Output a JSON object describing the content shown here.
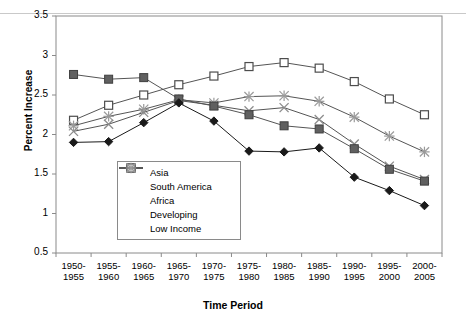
{
  "chart_data": {
    "type": "line",
    "title": "",
    "xlabel": "Time Period",
    "ylabel": "Percent Increase",
    "ylim": [
      0.5,
      3.5
    ],
    "ytick_labels": [
      "3.5",
      "3",
      "2.5",
      "2",
      "1.5",
      "1",
      "0.5"
    ],
    "ytick_values": [
      3.5,
      3,
      2.5,
      2,
      1.5,
      1,
      0.5
    ],
    "grid": false,
    "legend_position": "inside-bottom-left",
    "categories": [
      "1950-1955",
      "1955-1960",
      "1960-1965",
      "1965-1970",
      "1970-1975",
      "1975-1980",
      "1980-1985",
      "1985-1990",
      "1990-1995",
      "1995-2000",
      "2000-2005"
    ],
    "category_lines": [
      [
        "1950-",
        "1955"
      ],
      [
        "1955-",
        "1960"
      ],
      [
        "1960-",
        "1965"
      ],
      [
        "1965-",
        "1970"
      ],
      [
        "1970-",
        "1975"
      ],
      [
        "1975-",
        "1980"
      ],
      [
        "1980-",
        "1985"
      ],
      [
        "1985-",
        "1990"
      ],
      [
        "1990-",
        "1995"
      ],
      [
        "1995-",
        "2000"
      ],
      [
        "2000-",
        "2005"
      ]
    ],
    "series": [
      {
        "name": "Asia",
        "marker": "filled-diamond",
        "color": "#1a1a1a",
        "values": [
          1.9,
          1.91,
          2.15,
          2.4,
          2.17,
          1.79,
          1.78,
          1.83,
          1.46,
          1.29,
          1.1
        ]
      },
      {
        "name": "South America",
        "marker": "filled-square",
        "color": "#606060",
        "values": [
          2.76,
          2.7,
          2.72,
          2.45,
          2.36,
          2.25,
          2.11,
          2.07,
          1.82,
          1.56,
          1.41
        ]
      },
      {
        "name": "Africa",
        "marker": "open-square",
        "color": "#4d4d4d",
        "values": [
          2.18,
          2.37,
          2.5,
          2.63,
          2.74,
          2.86,
          2.91,
          2.84,
          2.67,
          2.45,
          2.25
        ]
      },
      {
        "name": "Developing",
        "marker": "cross-x",
        "color": "#8c8c8c",
        "values": [
          2.04,
          2.13,
          2.28,
          2.43,
          2.37,
          2.3,
          2.34,
          2.19,
          1.88,
          1.6,
          1.43
        ]
      },
      {
        "name": "Low Income",
        "marker": "asterisk",
        "color": "#9a9a9a",
        "values": [
          2.11,
          2.23,
          2.32,
          2.44,
          2.4,
          2.48,
          2.49,
          2.42,
          2.22,
          1.98,
          1.78
        ]
      }
    ]
  },
  "axis": {
    "y_title": "Percent Increase",
    "x_title": "Time Period"
  },
  "legend": {
    "items": [
      {
        "label": "Asia",
        "marker": "filled-diamond"
      },
      {
        "label": "South America",
        "marker": "filled-square"
      },
      {
        "label": "Africa",
        "marker": "open-square"
      },
      {
        "label": "Developing",
        "marker": "cross-x"
      },
      {
        "label": "Low Income",
        "marker": "asterisk"
      }
    ]
  },
  "colors": {
    "axis": "#8a8a8a",
    "plot_border": "#8a8a8a",
    "background": "#ffffff",
    "asia": "#1a1a1a",
    "south_america": "#606060",
    "africa": "#4d4d4d",
    "developing": "#8c8c8c",
    "low_income": "#9a9a9a"
  }
}
